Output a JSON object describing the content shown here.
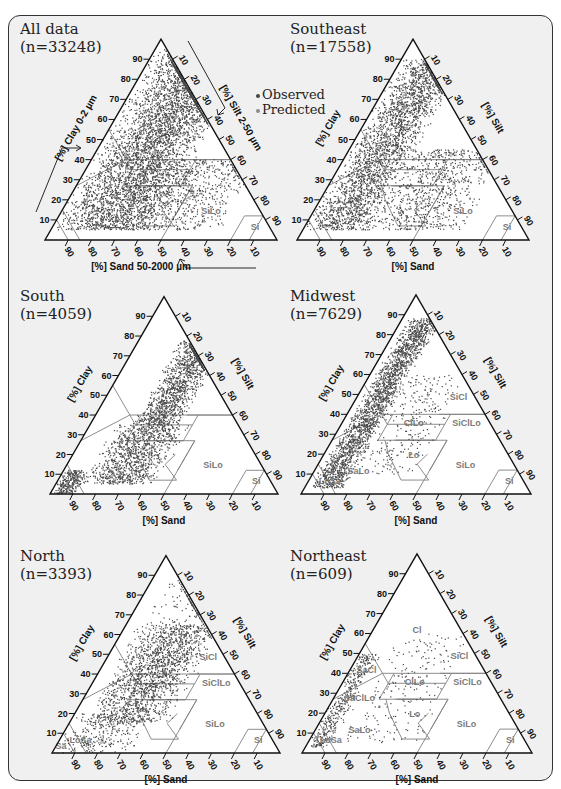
{
  "legend": {
    "observed_label": "Observed",
    "predicted_label": "Predicted",
    "observed_color": "#444444",
    "predicted_color": "#8a8a8a"
  },
  "axes": {
    "clay_short": "[%] Clay",
    "silt_short": "[%] Silt",
    "sand_short": "[%] Sand",
    "clay_long": "[%] Clay 0-2 µm",
    "silt_long": "[%] Silt 2-50 µm",
    "sand_long": "[%] Sand 50-2000 µm",
    "ticks": [
      10,
      20,
      30,
      40,
      50,
      60,
      70,
      80,
      90
    ]
  },
  "colors": {
    "frame_bg": "#f0f0f0",
    "frame_border": "#333333",
    "triangle_fill": "#ffffff",
    "triangle_border": "#111111",
    "class_line": "#808080",
    "class_label": "#7a7a7a",
    "point": "#4a4a4a"
  },
  "chart_data": [
    {
      "type": "scatter",
      "subtype": "ternary",
      "title": "All data",
      "subtitle": "(n=33248)",
      "n": 33248,
      "axis_labels": {
        "clay": "[%] Clay 0-2 µm",
        "silt": "[%] Silt 2-50 µm",
        "sand": "[%] Sand 50-2000 µm"
      },
      "show_direction_arrows": true,
      "show_legend": true,
      "visible_class_labels": [
        "SiLo",
        "Si"
      ],
      "density": "very dense; covers nearly all clay-rich/sandy region, clay 0-95%, silt mostly <50%",
      "clusters": [
        {
          "clay": [
            5,
            95
          ],
          "silt": [
            0,
            45
          ],
          "weight": 0.85
        },
        {
          "clay": [
            5,
            40
          ],
          "silt": [
            20,
            75
          ],
          "weight": 0.15
        }
      ]
    },
    {
      "type": "scatter",
      "subtype": "ternary",
      "title": "Southeast",
      "subtitle": "(n=17558)",
      "n": 17558,
      "axis_labels": {
        "clay": "[%] Clay",
        "silt": "[%] Silt",
        "sand": "[%] Sand"
      },
      "visible_class_labels": [
        "SiLo",
        "Si"
      ],
      "density": "dense along left (clay-sand) edge, thinning toward silt",
      "clusters": [
        {
          "clay": [
            5,
            90
          ],
          "silt": [
            0,
            30
          ],
          "weight": 0.75
        },
        {
          "clay": [
            5,
            45
          ],
          "silt": [
            20,
            70
          ],
          "weight": 0.25
        }
      ]
    },
    {
      "type": "scatter",
      "subtype": "ternary",
      "title": "South",
      "subtitle": "(n=4059)",
      "n": 4059,
      "axis_labels": {
        "clay": "[%] Clay",
        "silt": "[%] Silt",
        "sand": "[%] Sand"
      },
      "visible_class_labels": [
        "SiLo",
        "Si"
      ],
      "density": "dense cluster at clay 40-75% silt 20-40%; tail toward sandy low-clay corner",
      "clusters": [
        {
          "clay": [
            35,
            78
          ],
          "silt": [
            18,
            40
          ],
          "weight": 0.5
        },
        {
          "clay": [
            5,
            35
          ],
          "silt": [
            10,
            45
          ],
          "weight": 0.4
        },
        {
          "clay": [
            0,
            12
          ],
          "silt": [
            0,
            12
          ],
          "weight": 0.1
        }
      ]
    },
    {
      "type": "scatter",
      "subtype": "ternary",
      "title": "Midwest",
      "subtitle": "(n=7629)",
      "n": 7629,
      "axis_labels": {
        "clay": "[%] Clay",
        "silt": "[%] Silt",
        "sand": "[%] Sand"
      },
      "visible_class_labels": [
        "SiCl",
        "ClLo",
        "SiClLo",
        "Lo",
        "SiLo",
        "Si",
        "SaLo",
        "LoSa"
      ],
      "density": "narrow dense band along clay-sand edge, silt ~5-20%",
      "clusters": [
        {
          "clay": [
            3,
            88
          ],
          "silt": [
            2,
            18
          ],
          "weight": 0.9
        },
        {
          "clay": [
            10,
            60
          ],
          "silt": [
            15,
            45
          ],
          "weight": 0.1
        }
      ]
    },
    {
      "type": "scatter",
      "subtype": "ternary",
      "title": "North",
      "subtitle": "(n=3393)",
      "n": 3393,
      "axis_labels": {
        "clay": "[%] Clay",
        "silt": "[%] Silt",
        "sand": "[%] Sand"
      },
      "visible_class_labels": [
        "SiCl",
        "SiClLo",
        "SiLo",
        "Si",
        "LoSa",
        "Sa"
      ],
      "density": "broad spread, dense clay 20-60% silt 5-45%",
      "clusters": [
        {
          "clay": [
            15,
            65
          ],
          "silt": [
            5,
            45
          ],
          "weight": 0.7
        },
        {
          "clay": [
            30,
            90
          ],
          "silt": [
            5,
            40
          ],
          "weight": 0.15
        },
        {
          "clay": [
            0,
            20
          ],
          "silt": [
            0,
            35
          ],
          "weight": 0.15
        }
      ]
    },
    {
      "type": "scatter",
      "subtype": "ternary",
      "title": "Northeast",
      "subtitle": "(n=609)",
      "n": 609,
      "axis_labels": {
        "clay": "[%] Clay",
        "silt": "[%] Silt",
        "sand": "[%] Sand"
      },
      "visible_class_labels": [
        "Cl",
        "SiCl",
        "ClLo",
        "SiClLo",
        "SaCl",
        "SaClLo",
        "Lo",
        "SiLo",
        "Si",
        "SaLo",
        "LoSa"
      ],
      "density": "concentrated along clay-sand edge, sparse scatter in Cl, ClLo, Lo, SiLo",
      "clusters": [
        {
          "clay": [
            3,
            50
          ],
          "silt": [
            0,
            10
          ],
          "weight": 0.65
        },
        {
          "clay": [
            5,
            60
          ],
          "silt": [
            10,
            50
          ],
          "weight": 0.35
        }
      ]
    }
  ],
  "panels_layout": [
    {
      "title_x": 20,
      "title_y": 20,
      "x0": 45,
      "yb": 240,
      "w": 232,
      "dots": 5200,
      "seed": 11
    },
    {
      "title_x": 290,
      "title_y": 20,
      "x0": 297,
      "yb": 240,
      "w": 232,
      "dots": 3400,
      "seed": 23
    },
    {
      "title_x": 20,
      "title_y": 287,
      "x0": 50,
      "yb": 494,
      "w": 228,
      "dots": 2600,
      "seed": 37
    },
    {
      "title_x": 290,
      "title_y": 287,
      "x0": 301,
      "yb": 494,
      "w": 230,
      "dots": 2400,
      "seed": 41
    },
    {
      "title_x": 20,
      "title_y": 547,
      "x0": 52,
      "yb": 753,
      "w": 228,
      "dots": 2100,
      "seed": 53
    },
    {
      "title_x": 290,
      "title_y": 547,
      "x0": 302,
      "yb": 753,
      "w": 230,
      "dots": 620,
      "seed": 67
    }
  ],
  "texture_classes": {
    "Cl": [
      [
        0,
        100
      ],
      [
        45,
        55
      ],
      [
        20,
        55
      ],
      [
        0,
        40
      ],
      [
        20,
        40
      ],
      [
        20,
        45
      ],
      [
        0,
        45
      ]
    ],
    "SiCl": [
      [
        40,
        60
      ],
      [
        40,
        40
      ],
      [
        60,
        40
      ]
    ],
    "SiClLo": [
      [
        40,
        40
      ],
      [
        27,
        40
      ],
      [
        27,
        60
      ],
      [
        40,
        60
      ]
    ],
    "ClLo": [
      [
        27,
        40
      ],
      [
        40,
        40
      ],
      [
        40,
        20
      ],
      [
        27,
        20
      ]
    ],
    "SaCl": [
      [
        35,
        45
      ],
      [
        35,
        65
      ],
      [
        55,
        45
      ]
    ],
    "SaClLo": [
      [
        20,
        45
      ],
      [
        35,
        45
      ],
      [
        28,
        45
      ],
      [
        20,
        52
      ]
    ],
    "Lo": [
      [
        27,
        28
      ],
      [
        7,
        28
      ],
      [
        7,
        40
      ],
      [
        27,
        45
      ]
    ],
    "SiLo": [
      [
        27,
        50
      ],
      [
        0,
        50
      ],
      [
        0,
        80
      ],
      [
        12,
        80
      ],
      [
        12,
        88
      ],
      [
        27,
        73
      ]
    ],
    "Si": [
      [
        0,
        80
      ],
      [
        12,
        80
      ],
      [
        12,
        88
      ],
      [
        0,
        100
      ]
    ]
  },
  "class_boundaries": [
    [
      [
        55,
        0
      ],
      [
        40,
        15
      ],
      [
        40,
        60
      ]
    ],
    [
      [
        40,
        15
      ],
      [
        35,
        20
      ],
      [
        35,
        45
      ]
    ],
    [
      [
        40,
        40
      ],
      [
        40,
        60
      ]
    ],
    [
      [
        40,
        20
      ],
      [
        27,
        20
      ],
      [
        27,
        45
      ],
      [
        40,
        45
      ]
    ],
    [
      [
        27,
        28
      ],
      [
        27,
        45
      ]
    ],
    [
      [
        27,
        0
      ],
      [
        40,
        15
      ]
    ],
    [
      [
        27,
        23
      ],
      [
        20,
        28
      ],
      [
        7,
        40
      ],
      [
        7,
        52
      ],
      [
        15,
        43
      ],
      [
        20,
        45
      ]
    ],
    [
      [
        27,
        27
      ],
      [
        27,
        50
      ],
      [
        0,
        50
      ]
    ],
    [
      [
        12,
        80
      ],
      [
        12,
        88
      ],
      [
        0,
        88
      ]
    ],
    [
      [
        12,
        80
      ],
      [
        0,
        80
      ]
    ],
    [
      [
        15,
        0
      ],
      [
        0,
        15
      ]
    ],
    [
      [
        10,
        0
      ],
      [
        0,
        10
      ]
    ],
    [
      [
        27,
        50
      ],
      [
        12,
        50
      ]
    ]
  ],
  "class_label_positions": {
    "Cl": [
      60,
      20
    ],
    "SiCl": [
      47,
      45
    ],
    "ClLo": [
      34,
      32
    ],
    "SiClLo": [
      34,
      55
    ],
    "SaCl": [
      40,
      8
    ],
    "SaClLo": [
      26,
      12
    ],
    "Lo": [
      18,
      40
    ],
    "SiLo": [
      13,
      65
    ],
    "Si": [
      5,
      88
    ],
    "SaLo": [
      10,
      20
    ],
    "LoSa": [
      5,
      10
    ],
    "Sa": [
      2,
      3
    ]
  }
}
